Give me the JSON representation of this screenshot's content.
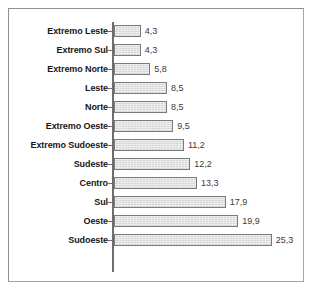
{
  "chart_data": {
    "type": "bar",
    "orientation": "horizontal",
    "title": "",
    "subtitle": "",
    "xlabel": "",
    "ylabel": "",
    "grid": false,
    "legend": false,
    "legend_position": "none",
    "axis_ticks_visible": false,
    "decimal_separator": ",",
    "xlim": [
      0,
      25.3
    ],
    "categories": [
      "Extremo Leste",
      "Extremo Sul",
      "Extremo Norte",
      "Leste",
      "Norte",
      "Extremo Oeste",
      "Extremo Sudoeste",
      "Sudeste",
      "Centro",
      "Sul",
      "Oeste",
      "Sudoeste"
    ],
    "values": [
      4.3,
      4.3,
      5.8,
      8.5,
      8.5,
      9.5,
      11.2,
      12.2,
      13.3,
      17.9,
      19.9,
      25.3
    ],
    "value_labels": [
      "4,3",
      "4,3",
      "5,8",
      "8,5",
      "8,5",
      "9,5",
      "11,2",
      "12,2",
      "13,3",
      "17,9",
      "19,9",
      "25,3"
    ],
    "bars": [
      {
        "category": "Extremo Leste",
        "value": 4.3,
        "label": "4,3"
      },
      {
        "category": "Extremo Sul",
        "value": 4.3,
        "label": "4,3"
      },
      {
        "category": "Extremo Norte",
        "value": 5.8,
        "label": "5,8"
      },
      {
        "category": "Leste",
        "value": 8.5,
        "label": "8,5"
      },
      {
        "category": "Norte",
        "value": 8.5,
        "label": "8,5"
      },
      {
        "category": "Extremo Oeste",
        "value": 9.5,
        "label": "9,5"
      },
      {
        "category": "Extremo Sudoeste",
        "value": 11.2,
        "label": "11,2"
      },
      {
        "category": "Sudeste",
        "value": 12.2,
        "label": "12,2"
      },
      {
        "category": "Centro",
        "value": 13.3,
        "label": "13,3"
      },
      {
        "category": "Sul",
        "value": 17.9,
        "label": "17,9"
      },
      {
        "category": "Oeste",
        "value": 19.9,
        "label": "19,9"
      },
      {
        "category": "Sudoeste",
        "value": 25.3,
        "label": "25,3"
      }
    ],
    "colors": {
      "bar_fill": "#d6d6d6",
      "bar_border": "#7a7a7a",
      "axis": "#6d6d6d",
      "frame": "#8e8e8e",
      "category_text": "#171717",
      "value_text": "#3b3b3b",
      "background": "#ffffff"
    }
  },
  "layout": {
    "axis_x_px": 103,
    "plot_top_px": 13,
    "row_pitch_px": 19,
    "bar_height_px": 12,
    "px_per_unit": 6.24
  }
}
